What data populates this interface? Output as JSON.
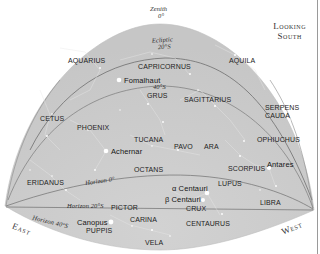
{
  "title": {
    "line1": "Looking",
    "line2": "South"
  },
  "directions": {
    "east": "East",
    "west": "West"
  },
  "reference_lines": {
    "zenith": {
      "name": "Zenith",
      "value": "0°"
    },
    "ecliptic": {
      "name": "Ecliptic",
      "value": "20°S"
    },
    "declination_40": {
      "value": "40°S"
    },
    "horizon_0": "Horizon 0°",
    "horizon_20": "Horizon 20°S",
    "horizon_40": "Horizon 40°S"
  },
  "constellations": [
    {
      "name": "AQUARIUS",
      "x": 68,
      "y": 57
    },
    {
      "name": "CAPRICORNUS",
      "x": 138,
      "y": 63
    },
    {
      "name": "AQUILA",
      "x": 229,
      "y": 57
    },
    {
      "name": "GRUS",
      "x": 147,
      "y": 92
    },
    {
      "name": "SAGITTARIUS",
      "x": 184,
      "y": 96
    },
    {
      "name": "SERPENS",
      "x": 265,
      "y": 104
    },
    {
      "name": "CAUDA",
      "x": 265,
      "y": 112
    },
    {
      "name": "CETUS",
      "x": 40,
      "y": 115
    },
    {
      "name": "PHOENIX",
      "x": 77,
      "y": 124
    },
    {
      "name": "TUCANA",
      "x": 134,
      "y": 136
    },
    {
      "name": "OPHIUCHUS",
      "x": 257,
      "y": 136
    },
    {
      "name": "PAVO",
      "x": 174,
      "y": 143
    },
    {
      "name": "ARA",
      "x": 204,
      "y": 143
    },
    {
      "name": "SCORPIUS",
      "x": 228,
      "y": 165
    },
    {
      "name": "OCTANS",
      "x": 134,
      "y": 166
    },
    {
      "name": "ERIDANUS",
      "x": 27,
      "y": 179
    },
    {
      "name": "LUPUS",
      "x": 218,
      "y": 180
    },
    {
      "name": "LIBRA",
      "x": 260,
      "y": 199
    },
    {
      "name": "PICTOR",
      "x": 111,
      "y": 204
    },
    {
      "name": "CRUX",
      "x": 186,
      "y": 205
    },
    {
      "name": "CARINA",
      "x": 130,
      "y": 216
    },
    {
      "name": "CENTAURUS",
      "x": 186,
      "y": 220
    },
    {
      "name": "PUPPIS",
      "x": 86,
      "y": 227
    },
    {
      "name": "VELA",
      "x": 145,
      "y": 239
    }
  ],
  "bright_stars": [
    {
      "name": "Fomalhaut",
      "x": 124,
      "y": 77,
      "dot_x": 119,
      "dot_y": 80
    },
    {
      "name": "Achernar",
      "x": 111,
      "y": 148,
      "dot_x": 106,
      "dot_y": 151
    },
    {
      "name": "Antares",
      "x": 267,
      "y": 161,
      "dot_x": 269,
      "dot_y": 168
    },
    {
      "name": "α Centauri",
      "x": 172,
      "y": 185,
      "dot_x": 207,
      "dot_y": 193
    },
    {
      "name": "β Centauri",
      "x": 165,
      "y": 196,
      "dot_x": 203,
      "dot_y": 200
    },
    {
      "name": "Canopus",
      "x": 77,
      "y": 219,
      "dot_x": 111,
      "dot_y": 222
    }
  ],
  "colors": {
    "sky": "#cfcfcf",
    "sky_edge": "#bdbdbd",
    "line": "#6e6e6e",
    "star": "#ffffff",
    "text": "#1e1e1e"
  }
}
